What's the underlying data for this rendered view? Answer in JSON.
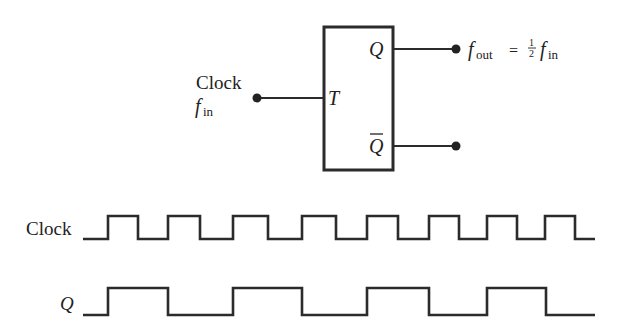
{
  "flipflop": {
    "input_label_line1": "Clock",
    "input_label_f": "f",
    "input_label_sub": "in",
    "pin_T": "T",
    "pin_Q": "Q",
    "pin_Qbar": "Q",
    "output_f": "f",
    "output_sub": "out",
    "output_eq": "=",
    "output_frac_num": "1",
    "output_frac_den": "2",
    "output_f2": "f",
    "output_sub2": "in"
  },
  "timing": {
    "clock_label": "Clock",
    "q_label": "Q",
    "colors": {
      "line": "#2b2b2b"
    },
    "clock_edges_x": [
      83,
      108,
      138,
      168,
      200,
      233,
      268,
      302,
      336,
      367,
      398,
      429,
      459,
      487,
      517,
      545,
      575,
      595
    ],
    "q_edges_x": [
      83,
      108,
      168,
      233,
      302,
      367,
      429,
      487,
      546,
      595
    ]
  }
}
